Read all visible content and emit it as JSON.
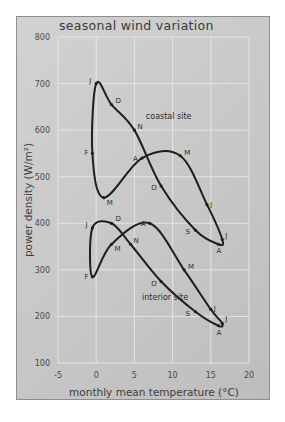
{
  "chart_data": {
    "type": "line",
    "title": "seasonal wind variation",
    "xlabel": "monthly mean temperature (°C)",
    "ylabel": "power density (W/m²)",
    "xlim": [
      -5,
      20
    ],
    "ylim": [
      100,
      800
    ],
    "xticks": [
      -5,
      0,
      5,
      10,
      15,
      20
    ],
    "yticks": [
      100,
      200,
      300,
      400,
      500,
      600,
      700,
      800
    ],
    "grid": true,
    "legend": "none (series labelled inline)",
    "series": [
      {
        "name": "coastal site",
        "label_pos": [
          6.5,
          625
        ],
        "points": [
          {
            "month": "J",
            "x": 0,
            "y": 700
          },
          {
            "month": "F",
            "x": -0.5,
            "y": 550
          },
          {
            "month": "M",
            "x": 1,
            "y": 455
          },
          {
            "month": "A",
            "x": 6,
            "y": 540
          },
          {
            "month": "M",
            "x": 11,
            "y": 545
          },
          {
            "month": "J",
            "x": 14.5,
            "y": 440
          },
          {
            "month": "J",
            "x": 16.5,
            "y": 365
          },
          {
            "month": "A",
            "x": 16,
            "y": 355
          },
          {
            "month": "S",
            "x": 13,
            "y": 385
          },
          {
            "month": "O",
            "x": 8.5,
            "y": 480
          },
          {
            "month": "N",
            "x": 5,
            "y": 600
          },
          {
            "month": "D",
            "x": 2,
            "y": 655
          }
        ]
      },
      {
        "name": "interior site",
        "label_pos": [
          6,
          235
        ],
        "points": [
          {
            "month": "J",
            "x": -0.5,
            "y": 390
          },
          {
            "month": "F",
            "x": -0.5,
            "y": 285
          },
          {
            "month": "M",
            "x": 2,
            "y": 355
          },
          {
            "month": "A",
            "x": 7,
            "y": 400
          },
          {
            "month": "M",
            "x": 11.5,
            "y": 300
          },
          {
            "month": "J",
            "x": 15,
            "y": 215
          },
          {
            "month": "J",
            "x": 16.5,
            "y": 185
          },
          {
            "month": "A",
            "x": 16,
            "y": 180
          },
          {
            "month": "S",
            "x": 13,
            "y": 210
          },
          {
            "month": "O",
            "x": 8.5,
            "y": 275
          },
          {
            "month": "N",
            "x": 4.5,
            "y": 355
          },
          {
            "month": "D",
            "x": 2,
            "y": 400
          }
        ]
      }
    ]
  },
  "labels": {
    "title": "seasonal wind variation",
    "xlabel": "monthly mean temperature (°C)",
    "ylabel": "power density (W/m²)",
    "coastal": "coastal site",
    "interior": "interior site"
  }
}
